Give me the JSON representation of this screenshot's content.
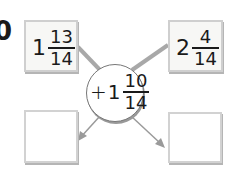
{
  "problem_number": "0",
  "top_left_box": {
    "whole": "1",
    "numerator": "13",
    "denominator": "14"
  },
  "top_right_box": {
    "whole": "2",
    "numerator": "4",
    "denominator": "14"
  },
  "operator_circle": {
    "operator": "+",
    "whole": "1",
    "numerator": "10",
    "denominator": "14"
  },
  "bottom_left_box": {
    "value": ""
  },
  "bottom_right_box": {
    "value": ""
  },
  "colors": {
    "connector": "#a8a8a8",
    "arrow": "#a0a0a0",
    "box_border": "#cfcfcf"
  }
}
